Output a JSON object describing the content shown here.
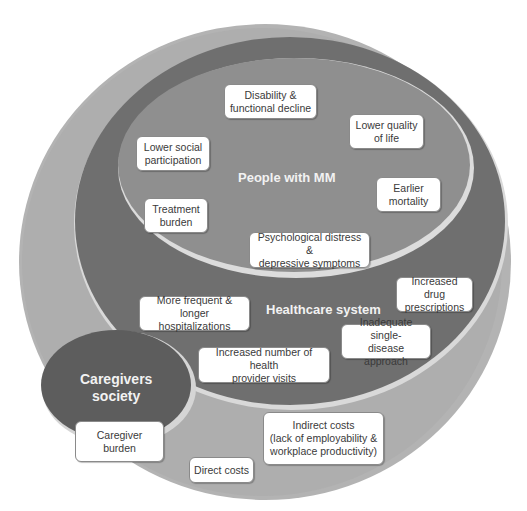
{
  "diagram": {
    "layers": [
      {
        "id": "society",
        "label": "",
        "color": "#b0b0b0"
      },
      {
        "id": "healthcare",
        "label": "Healthcare system",
        "color": "#6e6e6e"
      },
      {
        "id": "people",
        "label": "People with MM",
        "color": "#8e8e8e"
      },
      {
        "id": "caregivers",
        "label": "Caregivers society",
        "color": "#5e5e5e"
      }
    ],
    "labels": {
      "people": "People with MM",
      "healthcare": "Healthcare system",
      "caregivers_line1": "Caregivers",
      "caregivers_line2": "society"
    },
    "people_boxes": [
      {
        "line1": "Disability &",
        "line2": "functional decline"
      },
      {
        "line1": "Lower quality",
        "line2": "of life"
      },
      {
        "line1": "Lower social",
        "line2": "participation"
      },
      {
        "line1": "Earlier",
        "line2": "mortality"
      },
      {
        "line1": "Treatment",
        "line2": "burden"
      },
      {
        "line1": "Psychological distress &",
        "line2": "depressive symptoms"
      }
    ],
    "healthcare_boxes": [
      {
        "line1": "Increased drug",
        "line2": "prescriptions"
      },
      {
        "line1": "More frequent & longer",
        "line2": "hospitalizations"
      },
      {
        "line1": "Inadequate single-",
        "line2": "disease approach"
      },
      {
        "line1": "Increased number of health",
        "line2": "provider visits"
      }
    ],
    "society_boxes": [
      {
        "line1": "Caregiver",
        "line2": "burden"
      },
      {
        "line1": "Indirect costs",
        "line2": "(lack of employability &",
        "line3": "workplace productivity)"
      },
      {
        "line1": "Direct costs"
      }
    ]
  }
}
